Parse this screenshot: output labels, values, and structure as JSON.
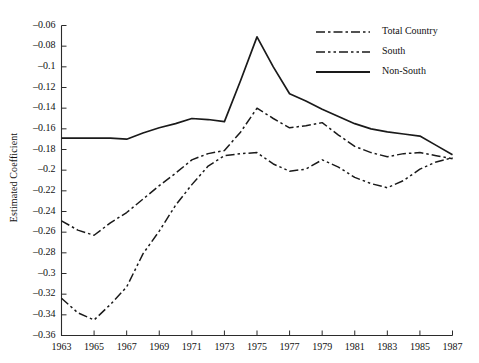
{
  "chart_data": {
    "type": "line",
    "title": "",
    "xlabel": "",
    "ylabel": "Estimated Coefficient",
    "x": [
      1963,
      1964,
      1965,
      1966,
      1967,
      1968,
      1969,
      1970,
      1971,
      1972,
      1973,
      1974,
      1975,
      1976,
      1977,
      1978,
      1979,
      1980,
      1981,
      1982,
      1983,
      1984,
      1985,
      1986,
      1987
    ],
    "xlim": [
      1963,
      1987
    ],
    "ylim": [
      -0.36,
      -0.06
    ],
    "grid": false,
    "legend_position": "top-right",
    "xticks": [
      "1963",
      "1965",
      "1967",
      "1969",
      "1971",
      "1973",
      "1975",
      "1977",
      "1979",
      "1981",
      "1983",
      "1985",
      "1987"
    ],
    "xtick_values": [
      1963,
      1965,
      1967,
      1969,
      1971,
      1973,
      1975,
      1977,
      1979,
      1981,
      1983,
      1985,
      1987
    ],
    "yticks": [
      "-0.06",
      "-0.08",
      "-0.1",
      "-0.12",
      "-0.14",
      "-0.16",
      "-0.18",
      "-0.2",
      "-0.22",
      "-0.24",
      "-0.26",
      "-0.28",
      "-0.3",
      "-0.32",
      "-0.34",
      "-0.36"
    ],
    "ytick_values": [
      -0.06,
      -0.08,
      -0.1,
      -0.12,
      -0.14,
      -0.16,
      -0.18,
      -0.2,
      -0.22,
      -0.24,
      -0.26,
      -0.28,
      -0.3,
      -0.32,
      -0.34,
      -0.36
    ],
    "series": [
      {
        "name": "Total Country",
        "style": "dash-dot",
        "color": "#1a1a1a",
        "values": [
          -0.249,
          -0.258,
          -0.263,
          -0.251,
          -0.241,
          -0.228,
          -0.215,
          -0.203,
          -0.19,
          -0.184,
          -0.181,
          -0.163,
          -0.14,
          -0.15,
          -0.159,
          -0.157,
          -0.154,
          -0.166,
          -0.177,
          -0.183,
          -0.187,
          -0.184,
          -0.183,
          -0.186,
          -0.189
        ]
      },
      {
        "name": "South",
        "style": "dash-dot-dot",
        "color": "#1a1a1a",
        "values": [
          -0.324,
          -0.338,
          -0.345,
          -0.33,
          -0.313,
          -0.281,
          -0.259,
          -0.234,
          -0.214,
          -0.196,
          -0.186,
          -0.184,
          -0.183,
          -0.194,
          -0.201,
          -0.199,
          -0.19,
          -0.197,
          -0.207,
          -0.213,
          -0.217,
          -0.21,
          -0.199,
          -0.192,
          -0.188
        ]
      },
      {
        "name": "Non-South",
        "style": "solid",
        "color": "#1a1a1a",
        "values": [
          -0.169,
          -0.169,
          -0.169,
          -0.169,
          -0.17,
          -0.164,
          -0.159,
          -0.155,
          -0.15,
          -0.151,
          -0.153,
          -0.113,
          -0.071,
          -0.1,
          -0.126,
          -0.133,
          -0.141,
          -0.148,
          -0.155,
          -0.16,
          -0.163,
          -0.165,
          -0.167,
          -0.176,
          -0.185
        ]
      }
    ]
  },
  "legend": {
    "items": [
      {
        "label": "Total Country"
      },
      {
        "label": "South"
      },
      {
        "label": "Non-South"
      }
    ]
  }
}
